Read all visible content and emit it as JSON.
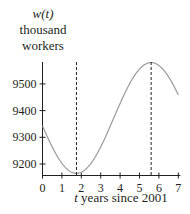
{
  "chart_data": {
    "type": "line",
    "title": "",
    "ylabel_lines": [
      "w(t)",
      "thousand",
      "workers"
    ],
    "ylabel_var": "w(t)",
    "ylabel_unit_1": "thousand",
    "ylabel_unit_2": "workers",
    "xlabel_var": "t",
    "xlabel_rest": " years since 2001",
    "xlabel": "t years since 2001",
    "x_ticks": [
      0,
      1,
      2,
      3,
      4,
      5,
      6,
      7
    ],
    "y_ticks": [
      9200,
      9300,
      9400,
      9500
    ],
    "xlim": [
      0,
      7
    ],
    "ylim": [
      9158,
      9600
    ],
    "grid": false,
    "series": [
      {
        "name": "w(t)",
        "x": [
          0,
          0.5,
          1,
          1.5,
          1.75,
          2,
          2.5,
          3,
          3.5,
          4,
          4.5,
          5,
          5.5,
          5.6,
          6,
          6.5,
          7
        ],
        "values": [
          9485,
          9380,
          9270,
          9185,
          9165,
          9170,
          9205,
          9270,
          9350,
          9440,
          9515,
          9563,
          9580,
          9580,
          9560,
          9490,
          9390
        ]
      }
    ],
    "annotations": [
      {
        "type": "vertical-dashed-line",
        "x": 1.75,
        "label": "minimum"
      },
      {
        "type": "vertical-dashed-line",
        "x": 5.6,
        "label": "maximum"
      }
    ],
    "colors": {
      "curve": "#9a9a9a",
      "axis": "#231f20",
      "dashed": "#231f20"
    }
  }
}
